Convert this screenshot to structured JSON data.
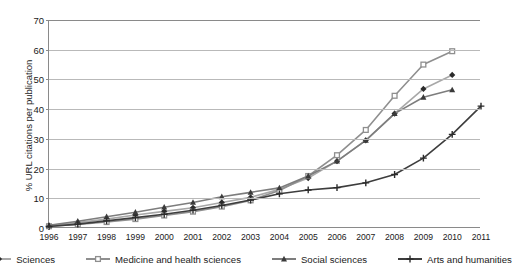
{
  "chart_data": {
    "type": "line",
    "title": "",
    "subtitle": "",
    "xlabel": "",
    "ylabel": "% URL citations per publication",
    "xlim": [
      1996,
      2011
    ],
    "ylim": [
      0,
      70
    ],
    "ytick_step": 10,
    "grid": true,
    "legend_position": "bottom",
    "x": [
      1996,
      1997,
      1998,
      1999,
      2000,
      2001,
      2002,
      2003,
      2004,
      2005,
      2006,
      2007,
      2008,
      2009,
      2010,
      2011
    ],
    "xticklabels": [
      "1996",
      "1997",
      "1998",
      "1999",
      "2000",
      "2001",
      "2002",
      "2003",
      "2004",
      "2005",
      "2006",
      "2007",
      "2008",
      "2009",
      "2010",
      "2011"
    ],
    "yticklabels": [
      "0",
      "10",
      "20",
      "30",
      "40",
      "50",
      "60",
      "70"
    ],
    "yticks": [
      0,
      10,
      20,
      30,
      40,
      50,
      60,
      70
    ],
    "series": [
      {
        "name": "Sciences",
        "marker": "diamond",
        "color": "#a8a8a8",
        "marker_color": "#2b2b2b",
        "x": [
          1996,
          1997,
          1998,
          1999,
          2000,
          2001,
          2002,
          2003,
          2004,
          2005,
          2006,
          2007,
          2008,
          2009,
          2010
        ],
        "values": [
          0.8,
          1.8,
          3.0,
          4.4,
          5.6,
          6.8,
          8.6,
          10.3,
          13.0,
          16.8,
          22.5,
          29.5,
          38.5,
          46.8,
          51.5
        ]
      },
      {
        "name": "Medicine and health sciences",
        "marker": "square",
        "color": "#8f8f8f",
        "marker_color": "#8f8f8f",
        "x": [
          1996,
          1997,
          1998,
          1999,
          2000,
          2001,
          2002,
          2003,
          2004,
          2005,
          2006,
          2007,
          2008,
          2009,
          2010
        ],
        "values": [
          0.6,
          1.2,
          2.0,
          3.0,
          4.2,
          5.5,
          7.2,
          9.3,
          12.6,
          17.5,
          24.5,
          33.0,
          44.5,
          55.0,
          59.5
        ]
      },
      {
        "name": "Social sciences",
        "marker": "triangle",
        "color": "#7d7d7d",
        "marker_color": "#3a3a3a",
        "x": [
          1996,
          1997,
          1998,
          1999,
          2000,
          2001,
          2002,
          2003,
          2004,
          2005,
          2006,
          2007,
          2008,
          2009,
          2010
        ],
        "values": [
          0.9,
          2.3,
          3.8,
          5.3,
          7.0,
          8.6,
          10.5,
          12.0,
          13.5,
          17.5,
          22.5,
          29.5,
          38.5,
          44.0,
          46.5
        ]
      },
      {
        "name": "Arts and humanities",
        "marker": "plus",
        "color": "#3d3d3d",
        "marker_color": "#2b2b2b",
        "x": [
          1996,
          1997,
          1998,
          1999,
          2000,
          2001,
          2002,
          2003,
          2004,
          2005,
          2006,
          2007,
          2008,
          2009,
          2010,
          2011
        ],
        "values": [
          0.5,
          1.3,
          2.4,
          3.5,
          4.6,
          6.0,
          7.6,
          9.4,
          11.5,
          12.8,
          13.6,
          15.2,
          18.0,
          23.5,
          31.5,
          41.0
        ]
      }
    ]
  },
  "legend": {
    "items": [
      {
        "label": "Sciences"
      },
      {
        "label": "Medicine and health sciences"
      },
      {
        "label": "Social sciences"
      },
      {
        "label": "Arts and humanities"
      }
    ]
  }
}
